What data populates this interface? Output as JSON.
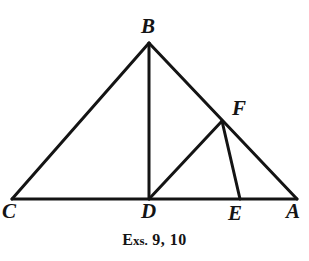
{
  "figure": {
    "caption": {
      "lead": "E",
      "small": "xs.",
      "numbers": " 9, 10",
      "full_text": "Exs. 9, 10"
    },
    "stroke_color": "#141414",
    "background_color": "#ffffff",
    "labels": [
      {
        "id": "B",
        "text": "B",
        "x": 141,
        "y": 16
      },
      {
        "id": "F",
        "text": "F",
        "x": 232,
        "y": 98
      },
      {
        "id": "C",
        "text": "C",
        "x": 2,
        "y": 201
      },
      {
        "id": "D",
        "text": "D",
        "x": 141,
        "y": 201
      },
      {
        "id": "E",
        "text": "E",
        "x": 228,
        "y": 203
      },
      {
        "id": "A",
        "text": "A",
        "x": 286,
        "y": 201
      }
    ],
    "points": {
      "A": {
        "x": 297,
        "y": 199
      },
      "B": {
        "x": 149,
        "y": 43
      },
      "C": {
        "x": 12,
        "y": 199
      },
      "D": {
        "x": 149,
        "y": 199
      },
      "E": {
        "x": 240,
        "y": 199
      },
      "F": {
        "x": 222,
        "y": 121
      }
    },
    "segments": [
      {
        "name": "segment-CB",
        "from": "C",
        "to": "B",
        "width": 3.0
      },
      {
        "name": "segment-BA",
        "from": "B",
        "to": "A",
        "width": 3.0
      },
      {
        "name": "segment-CA",
        "from": "C",
        "to": "A",
        "width": 3.0
      },
      {
        "name": "segment-BD",
        "from": "B",
        "to": "D",
        "width": 3.0
      },
      {
        "name": "segment-DF",
        "from": "D",
        "to": "F",
        "width": 3.0
      },
      {
        "name": "segment-FE",
        "from": "F",
        "to": "E",
        "width": 3.0
      }
    ]
  }
}
